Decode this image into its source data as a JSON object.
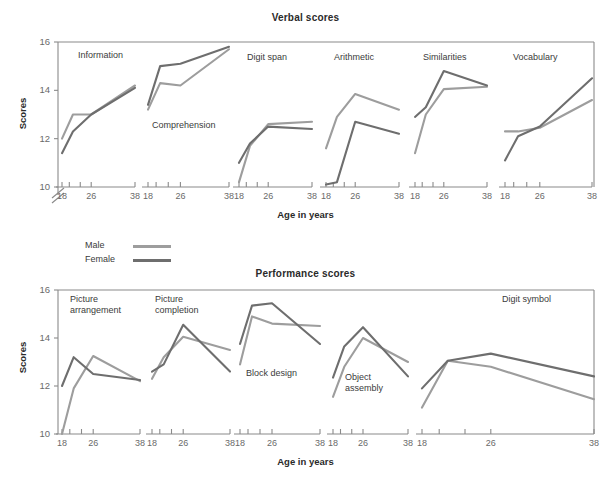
{
  "figure": {
    "legend": {
      "male_label": "Male",
      "female_label": "Female",
      "male_color": "#9d9d9d",
      "female_color": "#6e6e6e"
    },
    "axis_labels": {
      "y": "Scores",
      "x": "Age in years"
    }
  },
  "chart_data": [
    {
      "type": "line",
      "title": "Verbal scores",
      "xlabel": "Age in years",
      "ylabel": "Scores",
      "ylim": [
        10,
        16
      ],
      "yticks": [
        10,
        12,
        14,
        16
      ],
      "axis_break": true,
      "grid": false,
      "legend_position": "below-left",
      "x": [
        18,
        21,
        26,
        38
      ],
      "xticks": [
        18,
        20,
        23,
        26,
        38
      ],
      "xtick_labels": [
        "18",
        "26",
        "38"
      ],
      "panels": [
        {
          "name": "Information",
          "series": [
            {
              "name": "Male",
              "values": [
                12.0,
                13.0,
                13.0,
                14.2
              ]
            },
            {
              "name": "Female",
              "values": [
                11.4,
                12.3,
                13.0,
                14.1
              ]
            }
          ]
        },
        {
          "name": "Comprehension",
          "series": [
            {
              "name": "Male",
              "values": [
                13.2,
                14.3,
                14.2,
                15.7
              ]
            },
            {
              "name": "Female",
              "values": [
                13.4,
                15.0,
                15.1,
                15.8
              ]
            }
          ]
        },
        {
          "name": "Digit span",
          "series": [
            {
              "name": "Male",
              "values": [
                10.2,
                11.7,
                12.6,
                12.7
              ]
            },
            {
              "name": "Female",
              "values": [
                11.0,
                11.8,
                12.5,
                12.4
              ]
            }
          ]
        },
        {
          "name": "Arithmetic",
          "series": [
            {
              "name": "Male",
              "values": [
                11.6,
                12.9,
                13.85,
                13.2
              ]
            },
            {
              "name": "Female",
              "values": [
                10.1,
                10.2,
                12.7,
                12.2
              ]
            }
          ]
        },
        {
          "name": "Similarities",
          "series": [
            {
              "name": "Male",
              "values": [
                11.4,
                13.0,
                14.05,
                14.15
              ]
            },
            {
              "name": "Female",
              "values": [
                12.9,
                13.3,
                14.8,
                14.2
              ]
            }
          ]
        },
        {
          "name": "Vocabulary",
          "series": [
            {
              "name": "Male",
              "values": [
                12.3,
                12.3,
                12.45,
                13.6
              ]
            },
            {
              "name": "Female",
              "values": [
                11.1,
                12.1,
                12.5,
                14.5
              ]
            }
          ]
        }
      ]
    },
    {
      "type": "line",
      "title": "Performance scores",
      "xlabel": "Age in years",
      "ylabel": "Scores",
      "ylim": [
        10,
        16
      ],
      "yticks": [
        10,
        12,
        14,
        16
      ],
      "axis_break": false,
      "grid": false,
      "legend_position": "above-left",
      "x": [
        18,
        21,
        26,
        38
      ],
      "xticks": [
        18,
        20,
        23,
        26,
        38
      ],
      "xtick_labels": [
        "18",
        "26",
        "38"
      ],
      "panels": [
        {
          "name": "Picture\narrangement",
          "series": [
            {
              "name": "Male",
              "values": [
                10.0,
                11.9,
                13.25,
                12.2
              ]
            },
            {
              "name": "Female",
              "values": [
                12.0,
                13.2,
                12.5,
                12.25
              ]
            }
          ]
        },
        {
          "name": "Picture\ncompletion",
          "series": [
            {
              "name": "Male",
              "values": [
                12.3,
                13.2,
                14.05,
                13.5
              ]
            },
            {
              "name": "Female",
              "values": [
                12.6,
                12.9,
                14.55,
                12.6
              ]
            }
          ]
        },
        {
          "name": "Block design",
          "series": [
            {
              "name": "Male",
              "values": [
                12.9,
                14.9,
                14.6,
                14.5
              ]
            },
            {
              "name": "Female",
              "values": [
                13.75,
                15.35,
                15.45,
                13.75
              ]
            }
          ]
        },
        {
          "name": "Object\nassembly",
          "series": [
            {
              "name": "Male",
              "values": [
                11.55,
                12.8,
                14.0,
                13.0
              ]
            },
            {
              "name": "Female",
              "values": [
                12.35,
                13.65,
                14.45,
                12.4
              ]
            }
          ]
        },
        {
          "name": "Digit symbol",
          "series": [
            {
              "name": "Male",
              "values": [
                11.1,
                13.05,
                12.8,
                11.45
              ]
            },
            {
              "name": "Female",
              "values": [
                11.9,
                13.05,
                13.35,
                12.4
              ]
            }
          ]
        }
      ]
    }
  ]
}
